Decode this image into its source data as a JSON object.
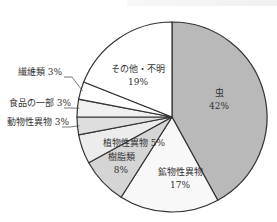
{
  "chart_data": {
    "type": "pie",
    "title": "",
    "start_angle_deg": 0,
    "direction": "clockwise",
    "center": [
      172,
      117
    ],
    "radius": 95,
    "slices": [
      {
        "label": "虫",
        "value": 42,
        "display": "42%",
        "color": "#b9b9b9",
        "label_pos": [
          219,
          96
        ],
        "inside": true
      },
      {
        "label": "鉱物性異物",
        "value": 17,
        "display": "17%",
        "color": "#f8f8f8",
        "label_pos": [
          180,
          175
        ],
        "inside": true
      },
      {
        "label": "樹脂類",
        "value": 8,
        "display": "8%",
        "color": "#d5d5d5",
        "label_pos": [
          121,
          160
        ],
        "inside": true
      },
      {
        "label": "植物性異物",
        "value": 5,
        "display": "5%",
        "color": "#ececec",
        "label_pos": [
          103,
          146
        ],
        "inside": false
      },
      {
        "label": "動物性異物",
        "value": 3,
        "display": "3%",
        "color": "#dedede",
        "label_pos": [
          38,
          125
        ],
        "inside": false
      },
      {
        "label": "食品の一部",
        "value": 3,
        "display": "3%",
        "color": "#f0f0f0",
        "label_pos": [
          40,
          106
        ],
        "inside": false
      },
      {
        "label": "繊維類",
        "value": 3,
        "display": "3%",
        "color": "#ffffff",
        "label_pos": [
          40,
          75
        ],
        "inside": false
      },
      {
        "label": "その他・不明",
        "value": 19,
        "display": "19%",
        "color": "#ffffff",
        "label_pos": [
          138,
          72
        ],
        "inside": true
      }
    ],
    "legend": null
  }
}
